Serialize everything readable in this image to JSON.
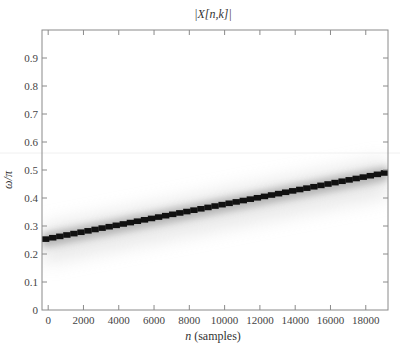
{
  "chart_data": {
    "type": "heatmap",
    "title": "|X[n,k]|",
    "xlabel": "n (samples)",
    "ylabel": "ω/π",
    "xlim": [
      -350,
      19260
    ],
    "ylim": [
      0,
      1.0
    ],
    "xticks": [
      0,
      2000,
      4000,
      6000,
      8000,
      10000,
      12000,
      14000,
      16000,
      18000
    ],
    "xtick_labels": [
      "0",
      "2000",
      "4000",
      "6000",
      "8000",
      "10000",
      "12000",
      "14000",
      "16000",
      "18000"
    ],
    "yticks": [
      0,
      0.1,
      0.2,
      0.3,
      0.4,
      0.5,
      0.6,
      0.7,
      0.8,
      0.9
    ],
    "ytick_labels": [
      "0",
      "0.1",
      "0.2",
      "0.3",
      "0.4",
      "0.5",
      "0.6",
      "0.7",
      "0.8",
      "0.9"
    ],
    "grid": false,
    "colormap": "grayscale (white = 0, black = max)",
    "ridge": {
      "description": "Linear chirp: dominant spectral magnitude ridge rising linearly",
      "n": [
        0,
        19100
      ],
      "omega_over_pi": [
        0.255,
        0.49
      ]
    }
  },
  "colors": {
    "background": "#ffffff",
    "axis": "#8a8a8a",
    "ridge": "#111111",
    "halo": "#c8c8c8"
  }
}
